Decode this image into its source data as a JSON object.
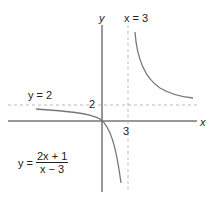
{
  "labels": {
    "y_axis": "y",
    "x_axis": "x",
    "vertical_asymptote": "x = 3",
    "horizontal_asymptote": "y = 2",
    "y_tick": "2",
    "x_tick": "3"
  },
  "equation": {
    "lhs": "y =",
    "numerator": "2x + 1",
    "denominator": "x − 3"
  },
  "colors": {
    "axis": "#333333",
    "curve": "#777777",
    "asymptote": "#bbbbbb"
  }
}
